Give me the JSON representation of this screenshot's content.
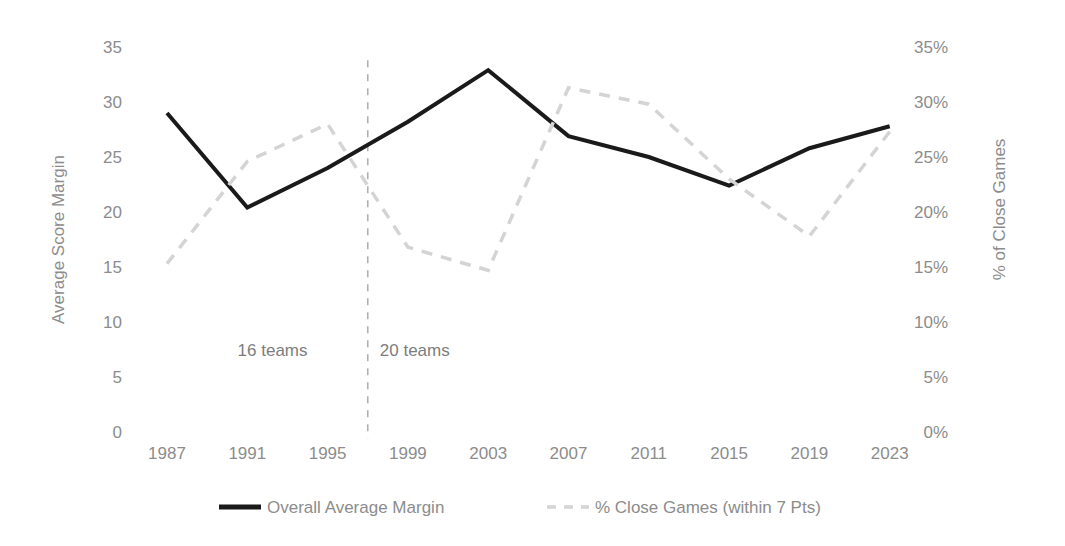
{
  "chart_data": {
    "type": "line",
    "title": "",
    "subtitle": "",
    "xlabel": "",
    "x": [
      1987,
      1991,
      1995,
      1999,
      2003,
      2007,
      2011,
      2015,
      2019,
      2023
    ],
    "categories": [
      "1987",
      "1991",
      "1995",
      "1999",
      "2003",
      "2007",
      "2011",
      "2015",
      "2019",
      "2023"
    ],
    "grid": false,
    "legend_position": "bottom",
    "series": [
      {
        "name": "Overall Average Margin",
        "axis": "left",
        "color": "#1a1a1a",
        "style": "solid",
        "width": 4,
        "values": [
          29.0,
          20.4,
          24.0,
          28.2,
          32.9,
          26.9,
          25.0,
          22.4,
          25.8,
          27.8
        ]
      },
      {
        "name": "% Close Games (within 7 Pts)",
        "axis": "right",
        "color": "#d4d4d4",
        "style": "dashed",
        "width": 3.5,
        "values": [
          15.3,
          24.6,
          28.0,
          16.8,
          14.7,
          31.3,
          29.8,
          23.0,
          17.8,
          27.3
        ]
      }
    ],
    "left_axis": {
      "label": "Average Score Margin",
      "min": 0,
      "max": 35,
      "step": 5,
      "ticks": [
        "0",
        "5",
        "10",
        "15",
        "20",
        "25",
        "30",
        "35"
      ],
      "tick_values": [
        0,
        5,
        10,
        15,
        20,
        25,
        30,
        35
      ]
    },
    "right_axis": {
      "label": "% of Close Games",
      "min": 0,
      "max": 35,
      "step": 5,
      "ticks": [
        "0%",
        "5%",
        "10%",
        "15%",
        "20%",
        "25%",
        "30%",
        "35%"
      ],
      "tick_values": [
        0,
        5,
        10,
        15,
        20,
        25,
        30,
        35
      ]
    },
    "annotations": [
      {
        "text": "16 teams",
        "x": 1994.0,
        "y": 7.5,
        "align": "end"
      },
      {
        "text": "20 teams",
        "x": 1997.6,
        "y": 7.5,
        "align": "start"
      }
    ],
    "divider": {
      "x": 1997.0,
      "y_top": 33.8,
      "y_bottom": -0.6,
      "style": "dashed",
      "color": "#b0b0b0"
    },
    "legend": [
      {
        "label": "Overall Average Margin",
        "color": "#1a1a1a",
        "style": "solid"
      },
      {
        "label": "% Close Games (within 7 Pts)",
        "color": "#d4d4d4",
        "style": "dashed"
      }
    ]
  },
  "colors": {
    "background": "#ffffff",
    "tick_text": "#8c8c8c",
    "axis_title": "#8c8c8c",
    "series_primary": "#1a1a1a",
    "series_secondary": "#d4d4d4",
    "divider": "#b0b0b0"
  }
}
